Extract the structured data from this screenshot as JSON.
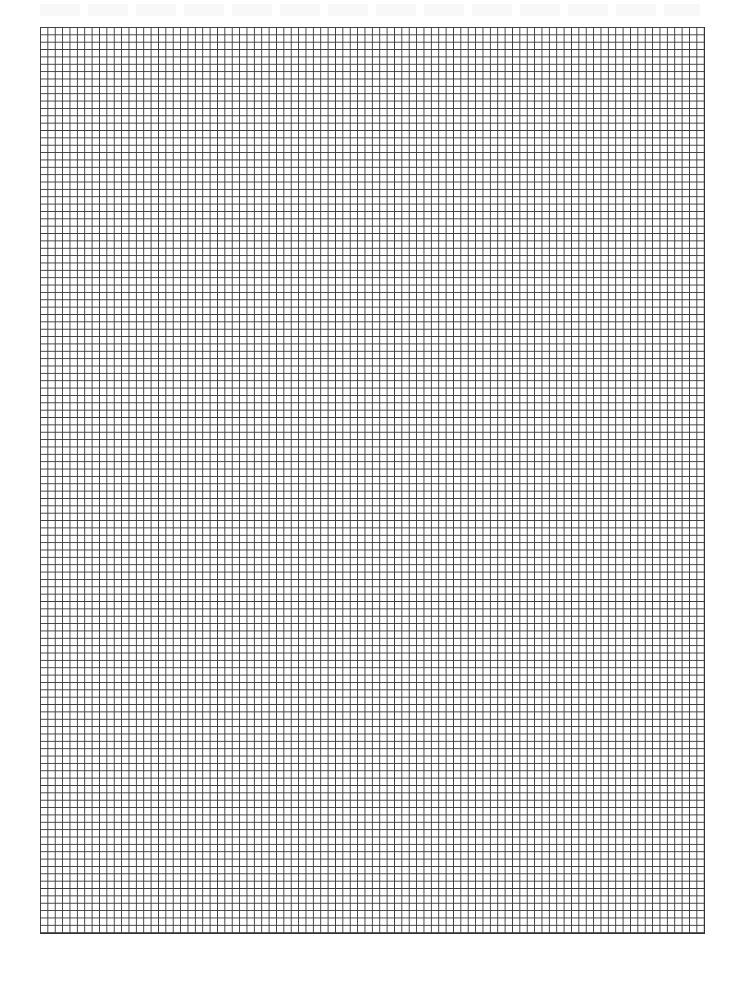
{
  "document": {
    "type": "graph-paper",
    "grid": {
      "columns": 90,
      "rows": 123,
      "line_color": "#3a3a3a",
      "background_color": "#ffffff"
    }
  }
}
